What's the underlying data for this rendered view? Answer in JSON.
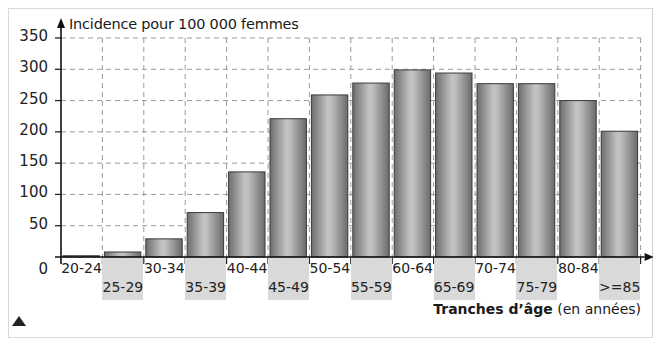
{
  "chart_data": {
    "type": "bar",
    "title": "",
    "ylabel": "Incidence pour 100 000 femmes",
    "xlabel_bold": "Tranches d’âge",
    "xlabel_rest": " (en années)",
    "categories": [
      "20-24",
      "25-29",
      "30-34",
      "35-39",
      "40-44",
      "45-49",
      "50-54",
      "55-59",
      "60-64",
      "65-69",
      "70-74",
      "75-79",
      "80-84",
      ">=85"
    ],
    "values": [
      2,
      8,
      29,
      71,
      136,
      221,
      259,
      278,
      299,
      294,
      277,
      277,
      250,
      201
    ],
    "yticks": [
      0,
      50,
      100,
      150,
      200,
      250,
      300,
      350
    ],
    "ylim": [
      0,
      350
    ],
    "grid": true,
    "legend": null
  },
  "colors": {
    "bar_dark": "#6e6e6e",
    "bar_light": "#c8c8c8",
    "grid": "#9a9a9a",
    "label_bg": "#d9d9d9"
  }
}
